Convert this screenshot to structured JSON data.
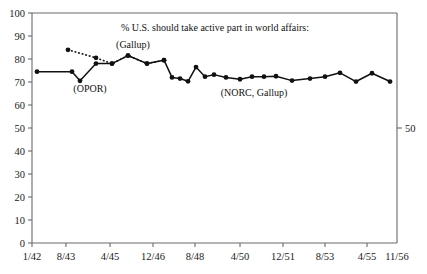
{
  "chart_data": {
    "type": "line",
    "title": "",
    "annotation_main": "% U.S. should take active part in world affairs:",
    "xlabel": "",
    "ylabel": "",
    "ylim": [
      0,
      100
    ],
    "yticks": [
      0,
      10,
      20,
      30,
      40,
      50,
      60,
      70,
      80,
      90,
      100
    ],
    "ytick_labels": [
      "0",
      "10",
      "20",
      "30",
      "40",
      "50",
      "60",
      "70",
      "80",
      "90",
      "100"
    ],
    "right_axis_ticks": [
      50
    ],
    "right_axis_tick_labels": [
      "50"
    ],
    "xtick_labels": [
      "1/42",
      "8/43",
      "4/45",
      "12/46",
      "8/48",
      "4/50",
      "12/51",
      "8/53",
      "4/55",
      "11/56"
    ],
    "xtick_positions": [
      32,
      66,
      110,
      153,
      195,
      240,
      283,
      325,
      367,
      397
    ],
    "grid": false,
    "legend_position": "inline-annotations",
    "series": [
      {
        "name": "OPOR / Gallup (dotted)",
        "label": "(Gallup)",
        "style": "dotted",
        "x": [
          68,
          96,
          112,
          128,
          147,
          164
        ],
        "values": [
          84.0,
          80.5,
          78.0,
          81.5,
          78.0,
          79.5
        ]
      },
      {
        "name": "NORC, Gallup (solid)",
        "label": "(NORC, Gallup)",
        "style": "solid",
        "x": [
          37,
          72,
          80,
          96,
          112,
          128,
          147,
          164,
          172,
          180,
          188,
          196,
          205,
          214,
          226,
          240,
          252,
          264,
          276,
          292,
          310,
          325,
          340,
          356,
          372,
          390
        ],
        "values": [
          74.5,
          74.5,
          70.5,
          78.0,
          78.0,
          81.5,
          78.0,
          79.5,
          72.0,
          71.5,
          70.3,
          76.5,
          72.3,
          73.2,
          72.0,
          71.2,
          72.3,
          72.3,
          72.5,
          70.6,
          71.5,
          72.3,
          74.0,
          70.2,
          73.8,
          70.2
        ]
      }
    ],
    "annotations": [
      {
        "name": "opor-label",
        "text": "(OPOR)",
        "x": 90,
        "y": 92
      },
      {
        "name": "gallup-label",
        "text": "(Gallup)",
        "x": 133,
        "y": 48
      },
      {
        "name": "norc-gallup-label",
        "text": "(NORC, Gallup)",
        "x": 254,
        "y": 96
      },
      {
        "name": "main-annotation",
        "text": "% U.S. should take active part in world affairs:",
        "x": 215,
        "y": 31
      }
    ],
    "cut_off_header_text": "partially cropped caption line above plot"
  },
  "axes": {
    "left_tick_labels": [
      "100",
      "90",
      "80",
      "70",
      "60",
      "50",
      "40",
      "30",
      "20",
      "10",
      "0"
    ],
    "right_tick_label": "50",
    "x_tick_labels": [
      "1/42",
      "8/43",
      "4/45",
      "12/46",
      "8/48",
      "4/50",
      "12/51",
      "8/53",
      "4/55",
      "11/56"
    ]
  }
}
